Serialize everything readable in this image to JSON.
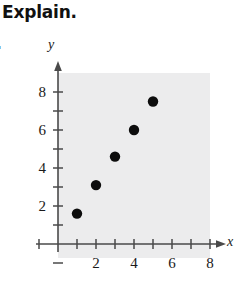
{
  "heading": {
    "prompt": "Explain.",
    "exercise_number": "."
  },
  "chart_data": {
    "type": "scatter",
    "title": "",
    "xlabel": "x",
    "ylabel": "y",
    "x": [
      1,
      2,
      3,
      4,
      5
    ],
    "y": [
      1.6,
      3.1,
      4.6,
      6.0,
      7.5
    ],
    "points": [
      {
        "x": 1,
        "y": 1.6
      },
      {
        "x": 2,
        "y": 3.1
      },
      {
        "x": 3,
        "y": 4.6
      },
      {
        "x": 4,
        "y": 6.0
      },
      {
        "x": 5,
        "y": 7.5
      }
    ],
    "xlim": [
      0,
      9
    ],
    "ylim": [
      0,
      8.6
    ],
    "x_tick_values": [
      1,
      2,
      3,
      4,
      5,
      6,
      7,
      8
    ],
    "x_tick_labels": [
      "",
      "2",
      "",
      "4",
      "",
      "6",
      "",
      "8"
    ],
    "y_tick_values": [
      1,
      2,
      3,
      4,
      5,
      6,
      7,
      8
    ],
    "y_tick_labels": [
      "",
      "2",
      "",
      "4",
      "",
      "6",
      "",
      "8"
    ],
    "grid": false,
    "legend": "none",
    "marker": "filled-circle",
    "marker_color": "#0d0d0d",
    "plot_background": "#ececed",
    "axis_color": "#4a4a4a"
  }
}
